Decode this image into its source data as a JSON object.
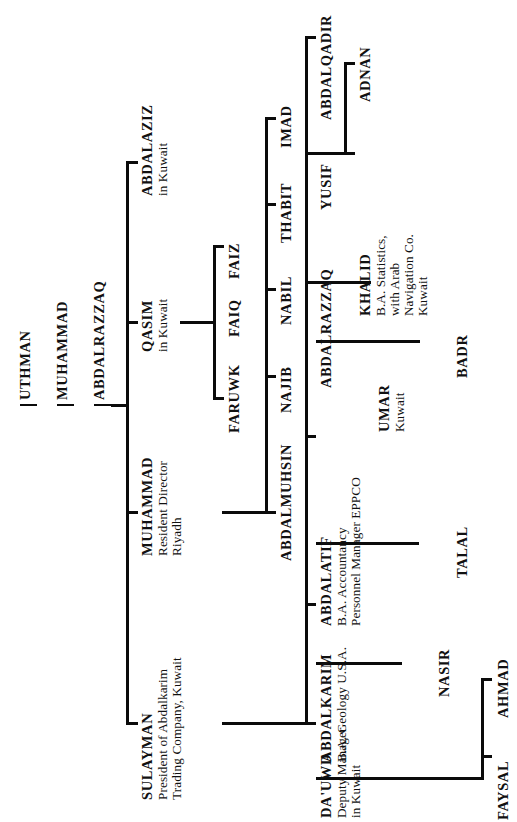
{
  "document": {
    "type": "genealogical-family-tree",
    "orientation": "rotated-90-counterclockwise",
    "background_color": "#ffffff",
    "line_color": "#0b0b0b"
  },
  "people": {
    "uthman": {
      "name": "UTHMAN",
      "details": []
    },
    "muhammad_root": {
      "name": "MUHAMMAD",
      "details": []
    },
    "abdalrazzaq_root": {
      "name": "ABDALRAZZAQ",
      "details": []
    },
    "abdalaziz": {
      "name": "ABDALAZIZ",
      "details": [
        "in Kuwait"
      ]
    },
    "qasim": {
      "name": "QASIM",
      "details": [
        "in Kuwait"
      ]
    },
    "muhammad": {
      "name": "MUHAMMAD",
      "details": [
        "Resident Director",
        "Riyadh"
      ]
    },
    "sulayman": {
      "name": "SULAYMAN",
      "details": [
        "President of Abdalkarim",
        "Trading Company, Kuwait"
      ]
    },
    "faruwk": {
      "name": "FARUWK",
      "details": []
    },
    "faiq": {
      "name": "FAIQ",
      "details": []
    },
    "faiz": {
      "name": "FAIZ",
      "details": []
    },
    "abdalmuhsin": {
      "name": "ABDALMUHSIN",
      "details": []
    },
    "najib": {
      "name": "NAJIB",
      "details": []
    },
    "nabil": {
      "name": "NABIL",
      "details": []
    },
    "thabit": {
      "name": "THABIT",
      "details": []
    },
    "imad": {
      "name": "IMAD",
      "details": []
    },
    "abdalatif": {
      "name": "ABDALATIF",
      "details": [
        "B.A. Accountancy",
        "Personnel Manager EPPCO"
      ]
    },
    "abdalrazzaq": {
      "name": "ABDALRAZZAQ",
      "details": []
    },
    "umar": {
      "name": "UMAR",
      "details": [
        "Kuwait"
      ]
    },
    "khalid": {
      "name": "KHALID",
      "details": [
        "B.A. Statistics,",
        "with Arab",
        "Navigation Co.",
        "Kuwait"
      ]
    },
    "yusif": {
      "name": "YUSIF",
      "details": []
    },
    "adnan": {
      "name": "ADNAN",
      "details": []
    },
    "abdalqadir": {
      "name": "ABDALQADIR",
      "details": []
    },
    "badr": {
      "name": "BADR",
      "details": []
    },
    "talal": {
      "name": "TALAL",
      "details": []
    },
    "abdalkarim": {
      "name": "ABDALKARIM",
      "details": [
        "B.A. Geology U.S.A."
      ]
    },
    "nasir": {
      "name": "NASIR",
      "details": []
    },
    "dauwd": {
      "name": "DA'UWD",
      "details": [
        "Deputy Manager",
        "in Kuwait"
      ]
    },
    "faysal": {
      "name": "FAYSAL",
      "details": []
    },
    "ahmad": {
      "name": "AHMAD",
      "details": []
    }
  }
}
